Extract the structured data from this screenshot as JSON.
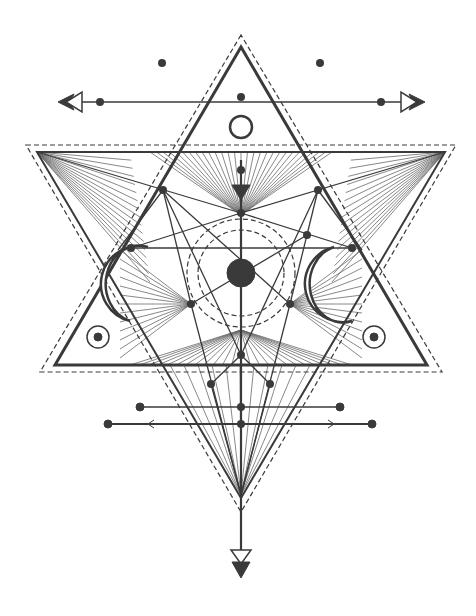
{
  "colors": {
    "ink": "#3a3a3a",
    "light": "#5a5a5a",
    "background": "#ffffff"
  },
  "center": {
    "x": 241,
    "y": 273
  },
  "up_triangle": {
    "solid": [
      [
        241,
        47
      ],
      [
        55,
        365
      ],
      [
        427,
        365
      ]
    ],
    "dashed": [
      [
        241,
        35
      ],
      [
        40,
        372
      ],
      [
        442,
        372
      ]
    ]
  },
  "down_triangle": {
    "solid": [
      [
        37,
        152
      ],
      [
        445,
        152
      ],
      [
        241,
        498
      ]
    ],
    "dashed": [
      [
        26,
        145
      ],
      [
        456,
        145
      ],
      [
        241,
        512
      ]
    ]
  },
  "circles": {
    "core_radius": 14,
    "dashed_inner": 43,
    "dashed_outer": 54,
    "top_ring": {
      "x": 241,
      "y": 127,
      "r": 11
    }
  },
  "side_eyes": [
    {
      "x": 98,
      "y": 337
    },
    {
      "x": 374,
      "y": 337
    }
  ],
  "moons": [
    {
      "side": "left",
      "x": 128,
      "y": 285
    },
    {
      "side": "right",
      "x": 354,
      "y": 285
    }
  ],
  "top_arrow": {
    "y": 102,
    "x1": 58,
    "x2": 425
  },
  "bottom_bars": [
    {
      "y": 407,
      "x1": 140,
      "x2": 340
    },
    {
      "y": 424,
      "x1": 108,
      "x2": 372
    }
  ],
  "bottom_arrow": {
    "x": 241,
    "y": 575
  },
  "dots": [
    [
      162,
      63
    ],
    [
      320,
      63
    ],
    [
      100,
      102
    ],
    [
      241,
      97
    ],
    [
      381,
      102
    ],
    [
      241,
      170
    ],
    [
      163,
      190
    ],
    [
      318,
      190
    ],
    [
      241,
      213
    ],
    [
      307,
      235
    ],
    [
      131,
      248
    ],
    [
      352,
      248
    ],
    [
      191,
      304
    ],
    [
      290,
      304
    ],
    [
      241,
      355
    ],
    [
      211,
      384
    ],
    [
      270,
      384
    ],
    [
      241,
      407
    ],
    [
      241,
      424
    ]
  ]
}
